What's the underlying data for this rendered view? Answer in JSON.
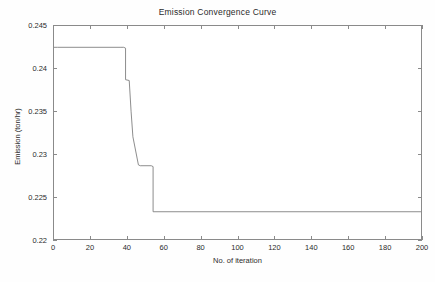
{
  "chart_data": {
    "type": "line",
    "title": "Emission Convergence Curve",
    "xlabel": "No. of iteration",
    "ylabel": "Emission (ton/hr)",
    "xlim": [
      0,
      200
    ],
    "ylim": [
      0.22,
      0.245
    ],
    "xticks": [
      0,
      20,
      40,
      60,
      80,
      100,
      120,
      140,
      160,
      180,
      200
    ],
    "xticklabels": [
      "0",
      "20",
      "40",
      "60",
      "80",
      "100",
      "120",
      "140",
      "160",
      "180",
      "200"
    ],
    "yticks": [
      0.22,
      0.225,
      0.23,
      0.235,
      0.24,
      0.245
    ],
    "yticklabels": [
      "0.22",
      "0.225",
      "0.23",
      "0.235",
      "0.24",
      "0.245"
    ],
    "grid": false,
    "legend": null,
    "line_color": "#808080",
    "line_width": 0.8,
    "series": [
      {
        "name": "Emission",
        "x": [
          0,
          2,
          36,
          38,
          39,
          39,
          41,
          42,
          43,
          46,
          47,
          53,
          54,
          54,
          200
        ],
        "y": [
          0.2425,
          0.2425,
          0.2425,
          0.2425,
          0.2424,
          0.2387,
          0.2386,
          0.235,
          0.232,
          0.2287,
          0.2286,
          0.2286,
          0.2285,
          0.2232,
          0.2232
        ]
      }
    ],
    "annotations": []
  },
  "figure": {
    "background": "#ffffff",
    "axes_color": "#8a8a8a",
    "text_color": "#2b2b2b"
  }
}
